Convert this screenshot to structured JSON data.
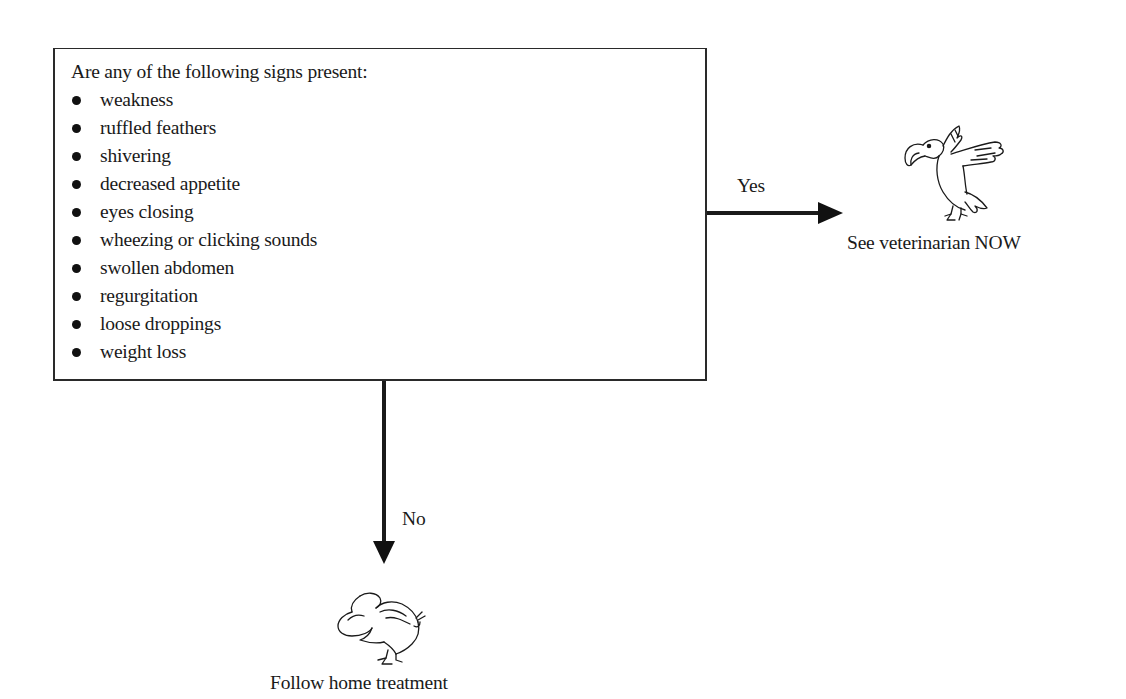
{
  "decision": {
    "question": "Are any of the following signs present:",
    "signs": [
      "weakness",
      "ruffled feathers",
      "shivering",
      "decreased appetite",
      "eyes closing",
      "wheezing or clicking sounds",
      "swollen abdomen",
      "regurgitation",
      "loose droppings",
      "weight loss"
    ]
  },
  "branches": {
    "yes": {
      "label": "Yes",
      "outcome": "See veterinarian NOW",
      "icon": "flying-parrot-icon"
    },
    "no": {
      "label": "No",
      "outcome": "Follow home treatment",
      "icon": "sick-parrot-icon"
    }
  },
  "colors": {
    "ink": "#1a1a1a",
    "background": "#ffffff"
  }
}
